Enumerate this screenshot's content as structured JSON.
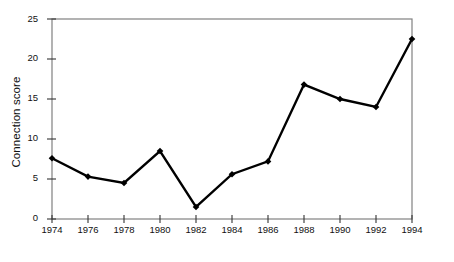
{
  "chart_data": {
    "type": "line",
    "title": "",
    "xlabel": "Year",
    "ylabel": "Connection score",
    "x": [
      1974,
      1976,
      1978,
      1980,
      1982,
      1984,
      1986,
      1988,
      1990,
      1992,
      1994
    ],
    "values": [
      7.6,
      5.3,
      4.5,
      8.5,
      1.5,
      5.6,
      7.2,
      16.8,
      15.0,
      14.0,
      22.5
    ],
    "series": [
      {
        "name": "Connection score",
        "values": [
          7.6,
          5.3,
          4.5,
          8.5,
          1.5,
          5.6,
          7.2,
          16.8,
          15.0,
          14.0,
          22.5
        ]
      }
    ],
    "categories": [
      "1974",
      "1976",
      "1978",
      "1980",
      "1982",
      "1984",
      "1986",
      "1988",
      "1990",
      "1992",
      "1994"
    ],
    "xlim": [
      1974,
      1994
    ],
    "ylim": [
      0,
      25
    ],
    "xticks": [
      "1974",
      "1976",
      "1978",
      "1980",
      "1982",
      "1984",
      "1986",
      "1988",
      "1990",
      "1992",
      "1994"
    ],
    "yticks": [
      "0",
      "5",
      "10",
      "15",
      "20",
      "25"
    ],
    "ytick_values": [
      0,
      5,
      10,
      15,
      20,
      25
    ],
    "grid": false,
    "legend": "none",
    "line_color": "#000000",
    "marker": "diamond",
    "marker_color": "#000000",
    "frame_color": "#777777",
    "background": "#ffffff"
  },
  "axes": {
    "x_title": "Year",
    "y_title": "Connection score"
  }
}
